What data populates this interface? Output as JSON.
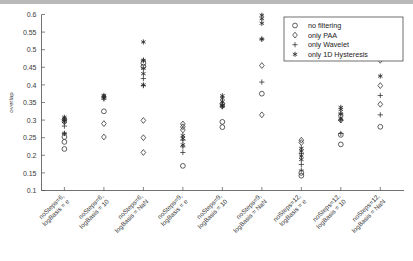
{
  "figure": {
    "title": "",
    "background": "#ffffff",
    "marker_color": "#2b2b2b"
  },
  "axes": {
    "ylabel": "overlap",
    "xlabel": "",
    "ylim": [
      0.1,
      0.6
    ],
    "yticks": [
      "0.1",
      "0.15",
      "0.2",
      "0.25",
      "0.3",
      "0.35",
      "0.4",
      "0.45",
      "0.5",
      "0.55",
      "0.6"
    ],
    "ytick_values": [
      0.1,
      0.15,
      0.2,
      0.25,
      0.3,
      0.35,
      0.4,
      0.45,
      0.5,
      0.55,
      0.6
    ],
    "grid": false
  },
  "legend": {
    "position": "top-right",
    "entries": [
      {
        "label": "no filtering",
        "marker": "circle-marker"
      },
      {
        "label": "only PAA",
        "marker": "diamond-marker"
      },
      {
        "label": "only Wavelet",
        "marker": "plus-marker"
      },
      {
        "label": "only 1D Hysteresis",
        "marker": "star-marker"
      }
    ]
  },
  "chart_data": {
    "type": "scatter",
    "title": "",
    "xlabel": "",
    "ylabel": "overlap",
    "ylim": [
      0.1,
      0.6
    ],
    "grid": false,
    "legend_position": "top-right",
    "categories": [
      "noSteps=6,\nlogBasis = e",
      "noSteps=6,\nlogBasis = 10",
      "noSteps=6,\nlogBasis = NaN",
      "noSteps=9,\nlogBasis = e",
      "noSteps=9,\nlogBasis = 10",
      "noSteps=9,\nlogBasis = NaN",
      "noSteps=12,\nlogBasis = e",
      "noSteps=12,\nlogBasis = 10",
      "noSteps=12,\nlogBasis = NaN"
    ],
    "category_labels": [
      {
        "line1": "noSteps=6,",
        "line2": "logBasis = e"
      },
      {
        "line1": "noSteps=6,",
        "line2": "logBasis = 10"
      },
      {
        "line1": "noSteps=6,",
        "line2": "logBasis = NaN"
      },
      {
        "line1": "noSteps=9,",
        "line2": "logBasis = e"
      },
      {
        "line1": "noSteps=9,",
        "line2": "logBasis = 10"
      },
      {
        "line1": "noSteps=9,",
        "line2": "logBasis = NaN"
      },
      {
        "line1": "noSteps=12,",
        "line2": "logBasis = e"
      },
      {
        "line1": "noSteps=12,",
        "line2": "logBasis = 10"
      },
      {
        "line1": "noSteps=12,",
        "line2": "logBasis = NaN"
      }
    ],
    "series": [
      {
        "name": "no filtering",
        "marker": "circle",
        "values": [
          [
            0.218,
            0.238,
            0.252
          ],
          [
            0.325
          ],
          [
            0.452,
            0.462
          ],
          [
            0.17
          ],
          [
            0.28,
            0.295
          ],
          [
            0.375
          ],
          [
            0.142,
            0.15
          ],
          [
            0.231,
            0.258
          ],
          [
            0.281
          ]
        ]
      },
      {
        "name": "only PAA",
        "marker": "diamond",
        "values": [
          [
            0.295,
            0.302
          ],
          [
            0.252,
            0.29
          ],
          [
            0.208,
            0.25,
            0.299
          ],
          [
            0.272,
            0.281,
            0.289
          ],
          [
            0.34,
            0.347
          ],
          [
            0.315,
            0.455
          ],
          [
            0.236,
            0.243
          ],
          [
            0.3,
            0.312
          ],
          [
            0.345,
            0.398,
            0.47
          ]
        ]
      },
      {
        "name": "only Wavelet",
        "marker": "plus",
        "values": [
          [
            0.262,
            0.283,
            0.3
          ],
          [
            0.36,
            0.366
          ],
          [
            0.398,
            0.418,
            0.47
          ],
          [
            0.208,
            0.224,
            0.243
          ],
          [
            0.338,
            0.345
          ],
          [
            0.408,
            0.53
          ],
          [
            0.158,
            0.174,
            0.205
          ],
          [
            0.262,
            0.3,
            0.318
          ],
          [
            0.315,
            0.37
          ]
        ]
      },
      {
        "name": "only 1D Hysteresis",
        "marker": "star",
        "values": [
          [
            0.262,
            0.296,
            0.303,
            0.308
          ],
          [
            0.362,
            0.367,
            0.37
          ],
          [
            0.4,
            0.432,
            0.447,
            0.47,
            0.522
          ],
          [
            0.23,
            0.248,
            0.256
          ],
          [
            0.34,
            0.352,
            0.362,
            0.369
          ],
          [
            0.53,
            0.575,
            0.588,
            0.598
          ],
          [
            0.188,
            0.198,
            0.212,
            0.22
          ],
          [
            0.303,
            0.318,
            0.33,
            0.336
          ],
          [
            0.425,
            0.495,
            0.53,
            0.555
          ]
        ]
      }
    ]
  }
}
